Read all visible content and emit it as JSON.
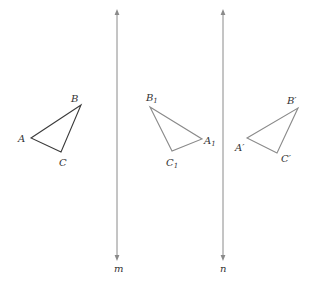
{
  "colors": {
    "original": "#3a3a3a",
    "image": "#8a8a8a",
    "line": "#8a8a8a",
    "label": "#333333"
  },
  "lines": [
    {
      "name": "m",
      "label": "m",
      "x": 117,
      "y1": 12,
      "y2": 258,
      "label_x": 114,
      "label_y": 272
    },
    {
      "name": "n",
      "label": "n",
      "x": 223,
      "y1": 12,
      "y2": 258,
      "label_x": 220,
      "label_y": 272
    }
  ],
  "triangles": [
    {
      "name": "ABC",
      "points": "31,138 81,105 61,152",
      "labels": [
        {
          "text": "A",
          "sub": "",
          "x": 18,
          "y": 142
        },
        {
          "text": "B",
          "sub": "",
          "x": 71,
          "y": 102
        },
        {
          "text": "C",
          "sub": "",
          "x": 59,
          "y": 166
        }
      ]
    },
    {
      "name": "A1B1C1",
      "points": "150,107 202,139 172,151",
      "labels": [
        {
          "text": "B",
          "sub": "1",
          "x": 146,
          "y": 101
        },
        {
          "text": "A",
          "sub": "1",
          "x": 204,
          "y": 144
        },
        {
          "text": "C",
          "sub": "1",
          "x": 166,
          "y": 166
        }
      ]
    },
    {
      "name": "A'B'C'",
      "points": "247,138 298,108 277,153",
      "labels": [
        {
          "text": "B′",
          "sub": "",
          "x": 287,
          "y": 104
        },
        {
          "text": "A′",
          "sub": "",
          "x": 235,
          "y": 151
        },
        {
          "text": "C′",
          "sub": "",
          "x": 281,
          "y": 162
        }
      ]
    }
  ]
}
